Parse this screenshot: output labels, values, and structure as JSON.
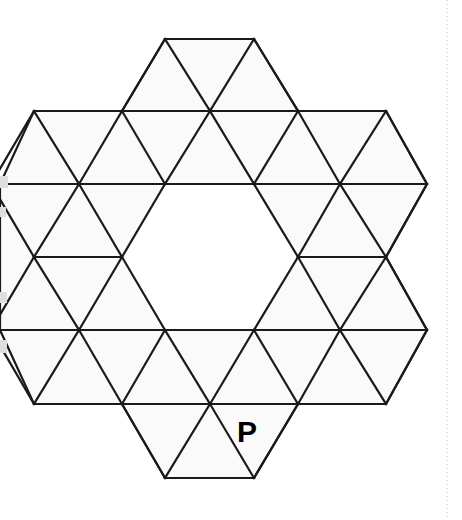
{
  "figure": {
    "kind": "geometry-diagram",
    "canvas": {
      "width": 462,
      "height": 520
    },
    "style": {
      "stroke_color": "#1a1a1a",
      "stroke_width": 2.2,
      "fill_color": "#fafafa",
      "background": "#ffffff"
    },
    "grid": {
      "row_y": [
        39,
        111,
        184,
        257,
        330,
        404,
        478
      ],
      "x_even": [
        -9,
        79,
        165,
        254,
        340,
        427
      ],
      "x_odd": [
        34,
        122,
        210,
        298,
        386
      ],
      "cell_width": 88,
      "row_height": 73
    },
    "outline_points": "165,39 254,39 298,111 386,111 427,184 386,257 427,330 386,404 298,404 254,478 165,478 122,404 34,404 0,330 0,257 0,184 34,111 122,111",
    "hole_points": "165,184 254,184 298,257 254,330 165,330 122,257",
    "edges": [
      {
        "name": "top-edge",
        "x1": 165,
        "y1": 39,
        "x2": 254,
        "y2": 39
      },
      {
        "name": "row-111-line",
        "x1": 34,
        "y1": 111,
        "x2": 386,
        "y2": 111
      },
      {
        "name": "row-184-line",
        "x1": 0,
        "y1": 184,
        "x2": 427,
        "y2": 184
      },
      {
        "name": "row-257-left-line",
        "x1": 34,
        "y1": 257,
        "x2": 122,
        "y2": 257
      },
      {
        "name": "row-257-right-line",
        "x1": 298,
        "y1": 257,
        "x2": 386,
        "y2": 257
      },
      {
        "name": "row-330-line",
        "x1": 0,
        "y1": 330,
        "x2": 427,
        "y2": 330
      },
      {
        "name": "row-404-line",
        "x1": 34,
        "y1": 404,
        "x2": 386,
        "y2": 404
      },
      {
        "name": "bottom-edge",
        "x1": 165,
        "y1": 478,
        "x2": 254,
        "y2": 478
      },
      {
        "name": "d1",
        "x1": 165,
        "y1": 39,
        "x2": 122,
        "y2": 111
      },
      {
        "name": "d2",
        "x1": 165,
        "y1": 39,
        "x2": 210,
        "y2": 111
      },
      {
        "name": "d3",
        "x1": 254,
        "y1": 39,
        "x2": 210,
        "y2": 111
      },
      {
        "name": "d4",
        "x1": 254,
        "y1": 39,
        "x2": 298,
        "y2": 111
      },
      {
        "name": "d5",
        "x1": 34,
        "y1": 111,
        "x2": 79,
        "y2": 184
      },
      {
        "name": "d6",
        "x1": 34,
        "y1": 111,
        "x2": -9,
        "y2": 184
      },
      {
        "name": "d7",
        "x1": 122,
        "y1": 111,
        "x2": 79,
        "y2": 184
      },
      {
        "name": "d8",
        "x1": 122,
        "y1": 111,
        "x2": 165,
        "y2": 184
      },
      {
        "name": "d9",
        "x1": 210,
        "y1": 111,
        "x2": 165,
        "y2": 184
      },
      {
        "name": "d10",
        "x1": 210,
        "y1": 111,
        "x2": 254,
        "y2": 184
      },
      {
        "name": "d11",
        "x1": 298,
        "y1": 111,
        "x2": 254,
        "y2": 184
      },
      {
        "name": "d12",
        "x1": 298,
        "y1": 111,
        "x2": 340,
        "y2": 184
      },
      {
        "name": "d13",
        "x1": 386,
        "y1": 111,
        "x2": 340,
        "y2": 184
      },
      {
        "name": "d14",
        "x1": 386,
        "y1": 111,
        "x2": 427,
        "y2": 184
      },
      {
        "name": "d15",
        "x1": -9,
        "y1": 184,
        "x2": 34,
        "y2": 257
      },
      {
        "name": "d16",
        "x1": 79,
        "y1": 184,
        "x2": 34,
        "y2": 257
      },
      {
        "name": "d17",
        "x1": 79,
        "y1": 184,
        "x2": 122,
        "y2": 257
      },
      {
        "name": "d18",
        "x1": 165,
        "y1": 184,
        "x2": 122,
        "y2": 257
      },
      {
        "name": "d19",
        "x1": 254,
        "y1": 184,
        "x2": 298,
        "y2": 257
      },
      {
        "name": "d20",
        "x1": 340,
        "y1": 184,
        "x2": 298,
        "y2": 257
      },
      {
        "name": "d21",
        "x1": 340,
        "y1": 184,
        "x2": 386,
        "y2": 257
      },
      {
        "name": "d22",
        "x1": 427,
        "y1": 184,
        "x2": 386,
        "y2": 257
      },
      {
        "name": "d23",
        "x1": 34,
        "y1": 257,
        "x2": -9,
        "y2": 330
      },
      {
        "name": "d24",
        "x1": 34,
        "y1": 257,
        "x2": 79,
        "y2": 330
      },
      {
        "name": "d25",
        "x1": 122,
        "y1": 257,
        "x2": 79,
        "y2": 330
      },
      {
        "name": "d26",
        "x1": 122,
        "y1": 257,
        "x2": 165,
        "y2": 330
      },
      {
        "name": "d27",
        "x1": 298,
        "y1": 257,
        "x2": 254,
        "y2": 330
      },
      {
        "name": "d28",
        "x1": 298,
        "y1": 257,
        "x2": 340,
        "y2": 330
      },
      {
        "name": "d29",
        "x1": 386,
        "y1": 257,
        "x2": 340,
        "y2": 330
      },
      {
        "name": "d30",
        "x1": 386,
        "y1": 257,
        "x2": 427,
        "y2": 330
      },
      {
        "name": "d31",
        "x1": -9,
        "y1": 330,
        "x2": 34,
        "y2": 404
      },
      {
        "name": "d32",
        "x1": 79,
        "y1": 330,
        "x2": 34,
        "y2": 404
      },
      {
        "name": "d33",
        "x1": 79,
        "y1": 330,
        "x2": 122,
        "y2": 404
      },
      {
        "name": "d34",
        "x1": 165,
        "y1": 330,
        "x2": 122,
        "y2": 404
      },
      {
        "name": "d35",
        "x1": 165,
        "y1": 330,
        "x2": 210,
        "y2": 404
      },
      {
        "name": "d36",
        "x1": 254,
        "y1": 330,
        "x2": 210,
        "y2": 404
      },
      {
        "name": "d37",
        "x1": 254,
        "y1": 330,
        "x2": 298,
        "y2": 404
      },
      {
        "name": "d38",
        "x1": 340,
        "y1": 330,
        "x2": 298,
        "y2": 404
      },
      {
        "name": "d39",
        "x1": 340,
        "y1": 330,
        "x2": 386,
        "y2": 404
      },
      {
        "name": "d40",
        "x1": 427,
        "y1": 330,
        "x2": 386,
        "y2": 404
      },
      {
        "name": "d41",
        "x1": 122,
        "y1": 404,
        "x2": 165,
        "y2": 478
      },
      {
        "name": "d42",
        "x1": 210,
        "y1": 404,
        "x2": 165,
        "y2": 478
      },
      {
        "name": "d43",
        "x1": 210,
        "y1": 404,
        "x2": 254,
        "y2": 478
      },
      {
        "name": "d44",
        "x1": 298,
        "y1": 404,
        "x2": 254,
        "y2": 478
      }
    ]
  },
  "labels": [
    {
      "name": "vertex-label-p",
      "text": "P",
      "x": 237,
      "y": 417,
      "font_size": 30,
      "color": "#000000"
    }
  ],
  "margin_rule": {
    "name": "page-margin-dotted-line",
    "x": 447,
    "y1": 0,
    "y2": 520,
    "color": "#b9b9b9",
    "dash": "1 3"
  },
  "scan_artifacts": {
    "name": "left-edge-scan-smudges",
    "color": "#dedede",
    "marks": [
      {
        "x": 0,
        "y": 176,
        "w": 8,
        "h": 12
      },
      {
        "x": 0,
        "y": 207,
        "w": 6,
        "h": 10
      },
      {
        "x": 0,
        "y": 292,
        "w": 7,
        "h": 11
      },
      {
        "x": 0,
        "y": 340,
        "w": 7,
        "h": 13
      }
    ]
  }
}
